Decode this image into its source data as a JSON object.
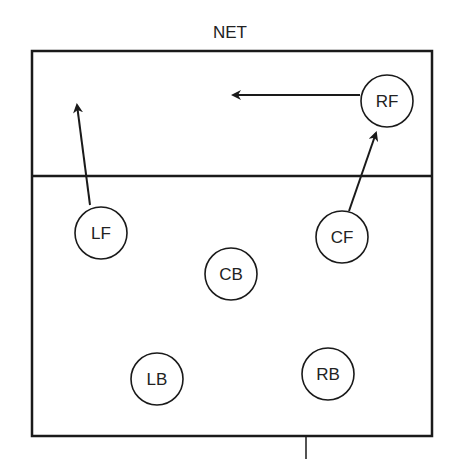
{
  "diagram": {
    "net_label": "NET",
    "players": [
      {
        "id": "LF",
        "label": "LF",
        "cx": 101,
        "cy": 233
      },
      {
        "id": "CF",
        "label": "CF",
        "cx": 342,
        "cy": 237
      },
      {
        "id": "RF",
        "label": "RF",
        "cx": 387,
        "cy": 101
      },
      {
        "id": "CB",
        "label": "CB",
        "cx": 231,
        "cy": 274
      },
      {
        "id": "LB",
        "label": "LB",
        "cx": 157,
        "cy": 379
      },
      {
        "id": "RB",
        "label": "RB",
        "cx": 328,
        "cy": 374
      }
    ],
    "arrows": [
      {
        "from": "LF",
        "description": "LF moves up toward net on left"
      },
      {
        "from": "CF",
        "description": "CF moves up toward right front"
      },
      {
        "from": "RF",
        "description": "RF moves left toward center front"
      }
    ],
    "colors": {
      "line": "#1a1a1a",
      "background": "#ffffff"
    }
  }
}
